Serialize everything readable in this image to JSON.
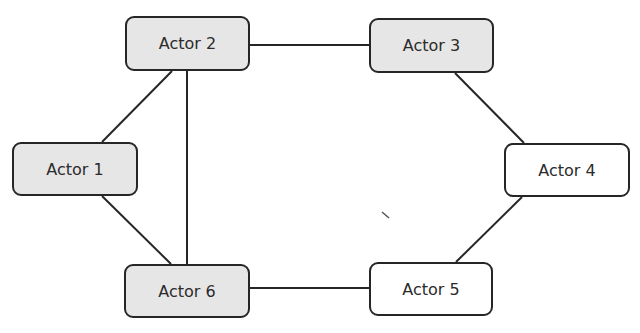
{
  "diagram": {
    "type": "network",
    "colors": {
      "shaded_fill": "#e6e6e6",
      "plain_fill": "#ffffff",
      "stroke": "#262626",
      "text": "#2b2b2b"
    },
    "nodes": [
      {
        "id": "actor1",
        "label": "Actor 1",
        "shaded": true,
        "x": 12,
        "y": 142,
        "w": 126,
        "h": 54
      },
      {
        "id": "actor2",
        "label": "Actor 2",
        "shaded": true,
        "x": 125,
        "y": 16,
        "w": 125,
        "h": 55
      },
      {
        "id": "actor3",
        "label": "Actor 3",
        "shaded": true,
        "x": 369,
        "y": 18,
        "w": 125,
        "h": 55
      },
      {
        "id": "actor4",
        "label": "Actor 4",
        "shaded": false,
        "x": 504,
        "y": 143,
        "w": 126,
        "h": 54
      },
      {
        "id": "actor5",
        "label": "Actor 5",
        "shaded": false,
        "x": 369,
        "y": 262,
        "w": 124,
        "h": 54
      },
      {
        "id": "actor6",
        "label": "Actor 6",
        "shaded": true,
        "x": 124,
        "y": 264,
        "w": 126,
        "h": 54
      }
    ],
    "edges": [
      {
        "from": "actor2",
        "to": "actor3",
        "x1": 250,
        "y1": 45,
        "x2": 369,
        "y2": 45
      },
      {
        "from": "actor3",
        "to": "actor4",
        "x1": 455,
        "y1": 73,
        "x2": 524,
        "y2": 143
      },
      {
        "from": "actor4",
        "to": "actor5",
        "x1": 522,
        "y1": 197,
        "x2": 456,
        "y2": 262
      },
      {
        "from": "actor5",
        "to": "actor6",
        "x1": 369,
        "y1": 288,
        "x2": 250,
        "y2": 288
      },
      {
        "from": "actor6",
        "to": "actor1",
        "x1": 171,
        "y1": 264,
        "x2": 102,
        "y2": 196
      },
      {
        "from": "actor1",
        "to": "actor2",
        "x1": 102,
        "y1": 142,
        "x2": 172,
        "y2": 71
      },
      {
        "from": "actor2",
        "to": "actor6",
        "x1": 187,
        "y1": 71,
        "x2": 187,
        "y2": 264
      }
    ],
    "stray_mark": {
      "x1": 382,
      "y1": 212,
      "x2": 389,
      "y2": 218
    }
  }
}
